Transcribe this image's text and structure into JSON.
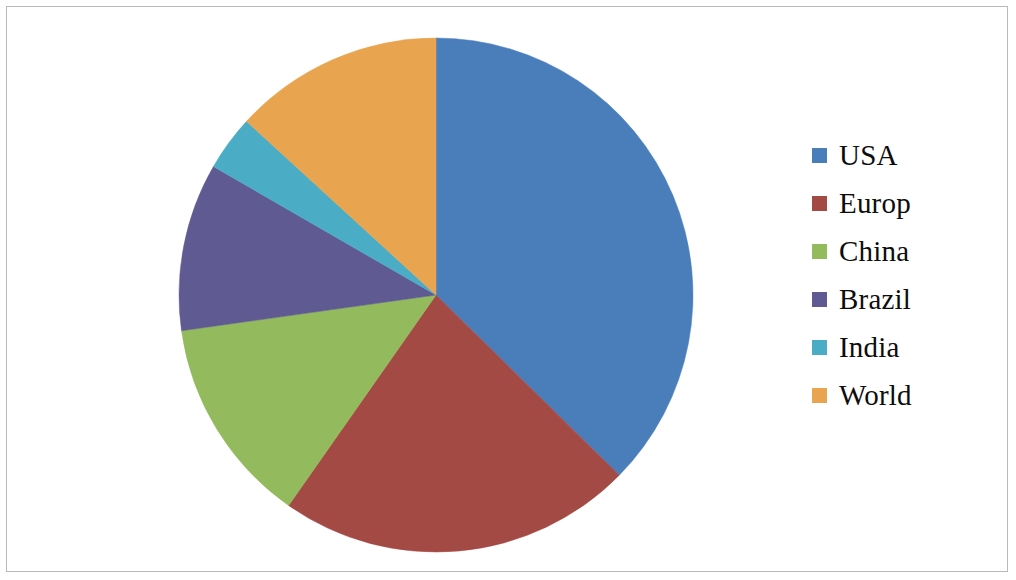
{
  "figure": {
    "background_color": "#ffffff",
    "border_color": "#b9b9b9"
  },
  "legend": {
    "position": "right",
    "items": [
      {
        "label": "USA",
        "color": "#4a7ebb"
      },
      {
        "label": "Europ",
        "color": "#a44a45"
      },
      {
        "label": "China",
        "color": "#93ba5d"
      },
      {
        "label": "Brazil",
        "color": "#5f5a92"
      },
      {
        "label": "India",
        "color": "#4bacc6"
      },
      {
        "label": "World",
        "color": "#e8a košik"
      }
    ]
  },
  "chart_data": {
    "type": "pie",
    "title": "",
    "subtitle": "",
    "xlabel": "",
    "ylabel": "",
    "grid": false,
    "legend_position": "right",
    "start_angle_deg": 0,
    "direction": "clockwise",
    "center": {
      "x": 436,
      "y": 295
    },
    "radius": 257,
    "categories": [
      "USA",
      "Europ",
      "China",
      "Brazil",
      "India",
      "World"
    ],
    "values": [
      37.4,
      22.4,
      13.1,
      10.5,
      3.5,
      13.2
    ],
    "units": "percent",
    "angles_deg": [
      134.5,
      80.5,
      47.0,
      38.0,
      12.5,
      47.5
    ],
    "colors": [
      "#4a7ebb",
      "#a44a45",
      "#93ba5d",
      "#5f5a92",
      "#4bacc6",
      "#e8a44f"
    ],
    "slices": [
      {
        "label": "USA",
        "value": 37.4,
        "start_deg": 0.0,
        "end_deg": 134.5,
        "color": "#4a7ebb"
      },
      {
        "label": "Europ",
        "value": 22.4,
        "start_deg": 134.5,
        "end_deg": 215.0,
        "color": "#a44a45"
      },
      {
        "label": "China",
        "value": 13.1,
        "start_deg": 215.0,
        "end_deg": 262.0,
        "color": "#93ba5d"
      },
      {
        "label": "Brazil",
        "value": 10.5,
        "start_deg": 262.0,
        "end_deg": 300.0,
        "color": "#5f5a92"
      },
      {
        "label": "India",
        "value": 3.5,
        "start_deg": 300.0,
        "end_deg": 312.5,
        "color": "#4bacc6"
      },
      {
        "label": "World",
        "value": 13.2,
        "start_deg": 312.5,
        "end_deg": 360.0,
        "color": "#e8a44f"
      }
    ]
  }
}
